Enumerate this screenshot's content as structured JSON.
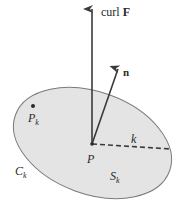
{
  "diagram": {
    "colors": {
      "surface_fill": "#e4e4e4",
      "surface_stroke": "#7a7a7a",
      "vector": "#3a3a3a",
      "text": "#2a2a2a",
      "background": "#ffffff"
    },
    "labels": {
      "curl_prefix": "curl ",
      "curl_field": "F",
      "normal": "n",
      "point_p": "P",
      "point_pk_main": "P",
      "point_pk_sub": "k",
      "radius": "k",
      "curve_main": "C",
      "curve_sub": "k",
      "surface_main": "S",
      "surface_sub": "k"
    },
    "elements": {
      "surface": "ellipse-shaded-region",
      "curl_vector": "vertical-arrow-from-P",
      "normal_vector": "slanted-arrow-from-P",
      "radius_line": "dashed-line-from-P-to-boundary"
    }
  }
}
